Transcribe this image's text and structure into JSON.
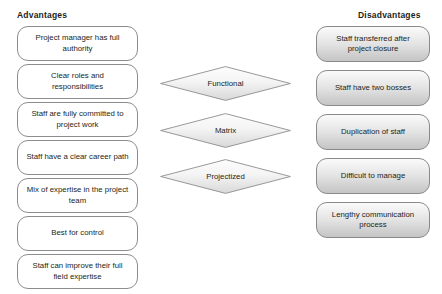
{
  "diagram": {
    "title_left": "Advantages",
    "title_right": "Disadvantages",
    "colors": {
      "box_border": "#8d8d8d",
      "text": "#231f20",
      "left_fill": "#ffffff",
      "gradient_light": "#fbfbfb",
      "gradient_dark": "#c6c6c6",
      "page_background": "#ffffff"
    }
  },
  "advantages": [
    {
      "label": "Project manager has full authority"
    },
    {
      "label": "Clear roles and responsibilities"
    },
    {
      "label": "Staff are fully committed to project work"
    },
    {
      "label": "Staff have a clear career path"
    },
    {
      "label": "Mix of expertise in the project team"
    },
    {
      "label": "Best for control"
    },
    {
      "label": "Staff can improve their full field expertise"
    }
  ],
  "structures": [
    {
      "label": "Functional"
    },
    {
      "label": "Matrix"
    },
    {
      "label": "Projectized"
    }
  ],
  "disadvantages": [
    {
      "label": "Staff transferred after project closure"
    },
    {
      "label": "Staff have two bosses"
    },
    {
      "label": "Duplication of staff"
    },
    {
      "label": "Difficult to manage"
    },
    {
      "label": "Lengthy communication process"
    }
  ]
}
